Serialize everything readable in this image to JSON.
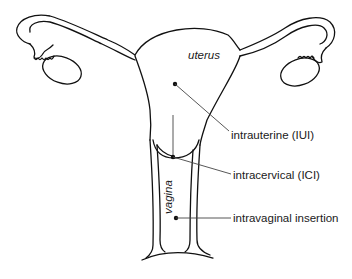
{
  "diagram": {
    "organ_labels": {
      "uterus": "uterus",
      "vagina": "vagina"
    },
    "callouts": [
      {
        "id": "iui",
        "label": "intrauterine (IUI)",
        "point": [
          155,
          84
        ],
        "label_pos": [
          231,
          136
        ]
      },
      {
        "id": "ici",
        "label": "intracervical (ICI)",
        "point": [
          174,
          158
        ],
        "label_pos": [
          233,
          176
        ]
      },
      {
        "id": "ivi",
        "label": "intravaginal insertion",
        "point": [
          176,
          219
        ],
        "label_pos": [
          233,
          219
        ]
      }
    ],
    "colors": {
      "line": "#111111",
      "leader": "#444444",
      "text": "#1a1a1a",
      "background": "#ffffff"
    }
  }
}
